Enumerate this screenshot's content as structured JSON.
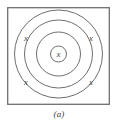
{
  "figure": {
    "caption": "(a)",
    "frame": {
      "border_color": "#6f6f6f",
      "border_width": 1.3,
      "background": "#ffffff"
    },
    "style": {
      "ring_color": "#5e5e5e",
      "ring_width": 0.9,
      "label_color": "#4a4a4a",
      "label_font_size": 9
    },
    "center": {
      "cx": 51.5,
      "cy": 47
    },
    "rings": [
      {
        "name": "outer-ring",
        "r": 44
      },
      {
        "name": "second-ring",
        "r": 34
      },
      {
        "name": "third-ring",
        "r": 22
      },
      {
        "name": "center-ring",
        "r": 8
      }
    ],
    "labels": [
      {
        "name": "x-label-center",
        "text": "x",
        "x": 51.5,
        "y": 50
      },
      {
        "name": "x-label-upper-left",
        "text": "x",
        "x": 19,
        "y": 34
      },
      {
        "name": "x-label-upper-right",
        "text": "x",
        "x": 84,
        "y": 34
      },
      {
        "name": "x-label-lower-left",
        "text": "x",
        "x": 19,
        "y": 78
      },
      {
        "name": "x-label-lower-right",
        "text": "x",
        "x": 84,
        "y": 78
      }
    ]
  }
}
